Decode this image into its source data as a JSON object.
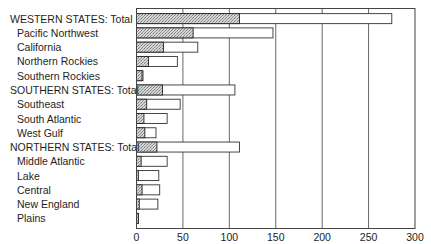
{
  "chart_data": {
    "type": "bar",
    "orientation": "horizontal",
    "stacked_overlay": true,
    "title": "",
    "xlabel": "",
    "ylabel": "",
    "xlim": [
      0,
      300
    ],
    "xticks": [
      0,
      50,
      100,
      150,
      200,
      250,
      300
    ],
    "grid": "vertical",
    "legend": "none",
    "categories": [
      "WESTERN STATES: Total",
      "Pacific Northwest",
      "California",
      "Northern Rockies",
      "Southern Rockies",
      "SOUTHERN STATES:  Total",
      "Southeast",
      "South Atlantic",
      "West Gulf",
      "NORTHERN STATES: Total",
      "Middle Atlantic",
      "Lake",
      "Central",
      "New England",
      "Plains"
    ],
    "indented": [
      false,
      true,
      true,
      true,
      true,
      false,
      true,
      true,
      true,
      false,
      true,
      true,
      true,
      true,
      true
    ],
    "series": [
      {
        "name": "hatched (inner)",
        "style": "hatched",
        "values": [
          111,
          61,
          29,
          13,
          6,
          28,
          11,
          8,
          9,
          22,
          5,
          2,
          6,
          3,
          2
        ]
      },
      {
        "name": "total (outer)",
        "style": "open",
        "values": [
          275,
          147,
          66,
          44,
          7,
          106,
          47,
          33,
          21,
          111,
          33,
          24,
          25,
          23,
          2
        ]
      }
    ]
  },
  "colors": {
    "hatch_fill": "#c8c8c8",
    "bar_outline": "#333333",
    "grid": "#555555"
  }
}
